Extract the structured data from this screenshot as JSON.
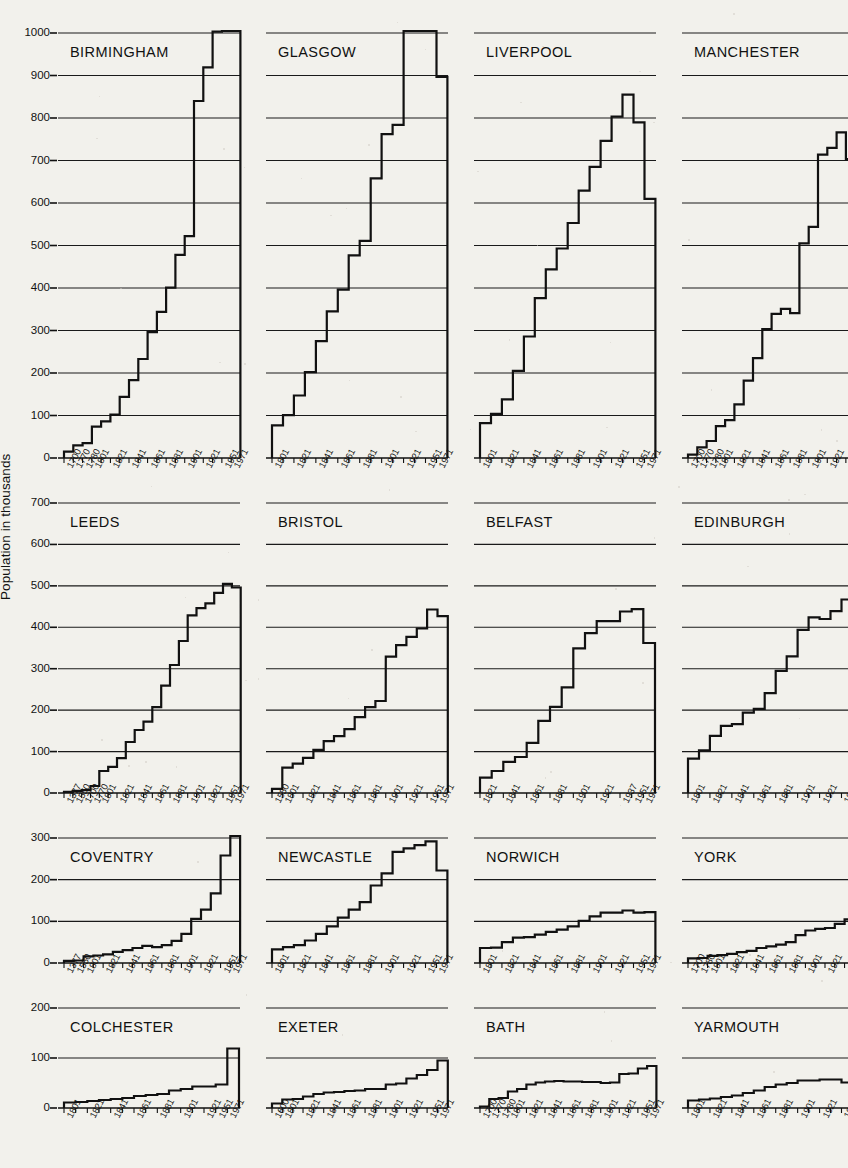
{
  "figure": {
    "y_axis_label": "Population in thousands",
    "units": "thousands"
  },
  "chart_data": {
    "type": "line",
    "title": "Population in thousands",
    "xlabel": "",
    "ylabel": "Population in thousands",
    "grid": true,
    "legend": "none",
    "note": "Small multiples: 16 step charts of British city population by census year. Four rows, each row shares a y-scale.",
    "rows": [
      {
        "row": 1,
        "ylim": [
          0,
          1000
        ],
        "yticks": [
          0,
          100,
          200,
          300,
          400,
          500,
          600,
          700,
          800,
          900,
          1000
        ]
      },
      {
        "row": 2,
        "ylim": [
          0,
          700
        ],
        "yticks": [
          0,
          100,
          200,
          300,
          400,
          500,
          600,
          700
        ]
      },
      {
        "row": 3,
        "ylim": [
          0,
          300
        ],
        "yticks": [
          0,
          100,
          200,
          300
        ]
      },
      {
        "row": 4,
        "ylim": [
          0,
          200
        ],
        "yticks": [
          0,
          100,
          200
        ]
      }
    ],
    "panels": [
      {
        "name": "BIRMINGHAM",
        "row": 1,
        "ylim": [
          0,
          1000
        ],
        "xticklabels": [
          "1700",
          "1770",
          "1780",
          "1801",
          "",
          "1821",
          "",
          "1841",
          "",
          "1861",
          "",
          "1881",
          "",
          "1901",
          "",
          "1921",
          "",
          "1951",
          "1971"
        ],
        "x": [
          1700,
          1770,
          1780,
          1801,
          1811,
          1821,
          1831,
          1841,
          1851,
          1861,
          1871,
          1881,
          1891,
          1901,
          1911,
          1921,
          1931,
          1951,
          1971
        ],
        "y": [
          15,
          30,
          35,
          74,
          86,
          102,
          144,
          183,
          233,
          296,
          344,
          401,
          478,
          522,
          840,
          919,
          1003,
          1113,
          1015
        ]
      },
      {
        "name": "GLASGOW",
        "row": 1,
        "ylim": [
          0,
          1000
        ],
        "xticklabels": [
          "1801",
          "",
          "1821",
          "",
          "1841",
          "",
          "1861",
          "",
          "1881",
          "",
          "1901",
          "",
          "1921",
          "",
          "1951",
          "1971"
        ],
        "x": [
          1801,
          1811,
          1821,
          1831,
          1841,
          1851,
          1861,
          1871,
          1881,
          1891,
          1901,
          1911,
          1921,
          1931,
          1951,
          1971
        ],
        "y": [
          77,
          101,
          147,
          202,
          275,
          345,
          396,
          477,
          511,
          658,
          762,
          784,
          1034,
          1088,
          1090,
          897
        ]
      },
      {
        "name": "LIVERPOOL",
        "row": 1,
        "ylim": [
          0,
          1000
        ],
        "xticklabels": [
          "1801",
          "",
          "1821",
          "",
          "1841",
          "",
          "1861",
          "",
          "1881",
          "",
          "1901",
          "",
          "1921",
          "",
          "1951",
          "1971"
        ],
        "x": [
          1801,
          1811,
          1821,
          1831,
          1841,
          1851,
          1861,
          1871,
          1881,
          1891,
          1901,
          1911,
          1921,
          1931,
          1951,
          1971
        ],
        "y": [
          82,
          104,
          138,
          205,
          286,
          376,
          444,
          493,
          553,
          629,
          685,
          746,
          803,
          855,
          790,
          610
        ]
      },
      {
        "name": "MANCHESTER",
        "row": 1,
        "ylim": [
          0,
          1000
        ],
        "xticklabels": [
          "1700",
          "1770",
          "1780",
          "1801",
          "",
          "1821",
          "",
          "1841",
          "",
          "1861",
          "",
          "1881",
          "",
          "1901",
          "",
          "1921",
          "",
          "1951",
          "1971"
        ],
        "x": [
          1700,
          1770,
          1780,
          1801,
          1811,
          1821,
          1831,
          1841,
          1851,
          1861,
          1871,
          1881,
          1891,
          1901,
          1911,
          1921,
          1931,
          1951,
          1971
        ],
        "y": [
          8,
          25,
          40,
          75,
          89,
          126,
          182,
          235,
          303,
          339,
          351,
          341,
          505,
          544,
          714,
          730,
          766,
          703,
          544
        ]
      },
      {
        "name": "LEEDS",
        "row": 2,
        "ylim": [
          0,
          700
        ],
        "xticklabels": [
          "1377",
          "1550",
          "1700",
          "1770",
          "1801",
          "",
          "1821",
          "",
          "1841",
          "",
          "1861",
          "",
          "1881",
          "",
          "1901",
          "",
          "1921",
          "",
          "1951",
          "1971"
        ],
        "x": [
          1377,
          1550,
          1700,
          1770,
          1801,
          1811,
          1821,
          1831,
          1841,
          1851,
          1861,
          1871,
          1881,
          1891,
          1901,
          1911,
          1921,
          1931,
          1951,
          1971
        ],
        "y": [
          3,
          5,
          7,
          17,
          53,
          63,
          84,
          123,
          152,
          172,
          207,
          259,
          309,
          367,
          429,
          446,
          458,
          483,
          505,
          496
        ]
      },
      {
        "name": "BRISTOL",
        "row": 2,
        "ylim": [
          0,
          700
        ],
        "xticklabels": [
          "1550",
          "1801",
          "",
          "1821",
          "",
          "1841",
          "",
          "1861",
          "",
          "1881",
          "",
          "1901",
          "",
          "1921",
          "",
          "1951",
          "1971"
        ],
        "x": [
          1550,
          1801,
          1811,
          1821,
          1831,
          1841,
          1851,
          1861,
          1871,
          1881,
          1891,
          1901,
          1911,
          1921,
          1931,
          1951,
          1971
        ],
        "y": [
          10,
          61,
          71,
          85,
          104,
          125,
          137,
          154,
          183,
          207,
          222,
          329,
          357,
          377,
          397,
          443,
          427
        ]
      },
      {
        "name": "BELFAST",
        "row": 2,
        "ylim": [
          0,
          700
        ],
        "xticklabels": [
          "1821",
          "",
          "1841",
          "",
          "1861",
          "",
          "1881",
          "",
          "1901",
          "",
          "1921",
          "",
          "1937",
          "1951",
          "1971"
        ],
        "x": [
          1821,
          1831,
          1841,
          1851,
          1861,
          1871,
          1881,
          1891,
          1901,
          1911,
          1921,
          1926,
          1937,
          1951,
          1971
        ],
        "y": [
          37,
          53,
          75,
          87,
          121,
          174,
          208,
          255,
          349,
          386,
          415,
          415,
          438,
          444,
          362
        ]
      },
      {
        "name": "EDINBURGH",
        "row": 2,
        "ylim": [
          0,
          700
        ],
        "xticklabels": [
          "1801",
          "",
          "1821",
          "",
          "1841",
          "",
          "1861",
          "",
          "1881",
          "",
          "1901",
          "",
          "1921",
          "",
          "1951",
          "1971"
        ],
        "x": [
          1801,
          1811,
          1821,
          1831,
          1841,
          1851,
          1861,
          1871,
          1881,
          1891,
          1901,
          1911,
          1921,
          1931,
          1951,
          1971
        ],
        "y": [
          83,
          103,
          138,
          162,
          166,
          194,
          203,
          241,
          295,
          330,
          394,
          424,
          420,
          439,
          467,
          453
        ]
      },
      {
        "name": "COVENTRY",
        "row": 3,
        "ylim": [
          0,
          300
        ],
        "xticklabels": [
          "1377",
          "1550",
          "1801",
          "",
          "1821",
          "",
          "1841",
          "",
          "1861",
          "",
          "1881",
          "",
          "1901",
          "",
          "1921",
          "",
          "1951",
          "1971"
        ],
        "x": [
          1377,
          1550,
          1801,
          1811,
          1821,
          1831,
          1841,
          1851,
          1861,
          1871,
          1881,
          1891,
          1901,
          1911,
          1921,
          1931,
          1951,
          1971
        ],
        "y": [
          5,
          6,
          16,
          18,
          21,
          27,
          31,
          36,
          41,
          38,
          43,
          53,
          70,
          106,
          128,
          167,
          258,
          335
        ]
      },
      {
        "name": "NEWCASTLE",
        "row": 3,
        "ylim": [
          0,
          300
        ],
        "xticklabels": [
          "1801",
          "",
          "1821",
          "",
          "1841",
          "",
          "1861",
          "",
          "1881",
          "",
          "1901",
          "",
          "1921",
          "",
          "1951",
          "1971"
        ],
        "x": [
          1801,
          1811,
          1821,
          1831,
          1841,
          1851,
          1861,
          1871,
          1881,
          1891,
          1901,
          1911,
          1921,
          1931,
          1951,
          1971
        ],
        "y": [
          33,
          38,
          43,
          54,
          70,
          88,
          109,
          128,
          146,
          186,
          215,
          267,
          275,
          283,
          292,
          222
        ]
      },
      {
        "name": "NORWICH",
        "row": 3,
        "ylim": [
          0,
          300
        ],
        "xticklabels": [
          "1801",
          "",
          "1821",
          "",
          "1841",
          "",
          "1861",
          "",
          "1881",
          "",
          "1901",
          "",
          "1921",
          "",
          "1951",
          "1971"
        ],
        "x": [
          1801,
          1811,
          1821,
          1831,
          1841,
          1851,
          1861,
          1871,
          1881,
          1891,
          1901,
          1911,
          1921,
          1931,
          1951,
          1971
        ],
        "y": [
          36,
          37,
          50,
          61,
          62,
          68,
          75,
          80,
          88,
          101,
          112,
          121,
          121,
          126,
          121,
          122
        ]
      },
      {
        "name": "YORK",
        "row": 3,
        "ylim": [
          0,
          300
        ],
        "xticklabels": [
          "1700",
          "1780",
          "1801",
          "",
          "1821",
          "",
          "1841",
          "",
          "1861",
          "",
          "1881",
          "",
          "1901",
          "",
          "1921",
          "",
          "1951",
          "1971"
        ],
        "x": [
          1700,
          1780,
          1801,
          1811,
          1821,
          1831,
          1841,
          1851,
          1861,
          1871,
          1881,
          1891,
          1901,
          1911,
          1921,
          1931,
          1951,
          1971
        ],
        "y": [
          11,
          12,
          17,
          19,
          22,
          26,
          29,
          36,
          40,
          44,
          50,
          67,
          78,
          82,
          84,
          94,
          105,
          105
        ]
      },
      {
        "name": "COLCHESTER",
        "row": 4,
        "ylim": [
          0,
          200
        ],
        "xticklabels": [
          "1801",
          "",
          "1821",
          "",
          "1841",
          "",
          "1861",
          "",
          "1881",
          "",
          "1901",
          "",
          "1921",
          "1951",
          "1971"
        ],
        "x": [
          1801,
          1811,
          1821,
          1831,
          1841,
          1851,
          1861,
          1871,
          1881,
          1891,
          1901,
          1911,
          1921,
          1951,
          1971
        ],
        "y": [
          11,
          12,
          14,
          16,
          18,
          20,
          24,
          26,
          28,
          35,
          38,
          43,
          43,
          47,
          119
        ]
      },
      {
        "name": "EXETER",
        "row": 4,
        "ylim": [
          0,
          200
        ],
        "xticklabels": [
          "1600",
          "1801",
          "",
          "1821",
          "",
          "1841",
          "",
          "1861",
          "",
          "1881",
          "",
          "1901",
          "",
          "1921",
          "",
          "1951",
          "1971"
        ],
        "x": [
          1600,
          1801,
          1811,
          1821,
          1831,
          1841,
          1851,
          1861,
          1871,
          1881,
          1891,
          1901,
          1911,
          1921,
          1931,
          1951,
          1971
        ],
        "y": [
          9,
          17,
          18,
          23,
          28,
          31,
          32,
          34,
          35,
          38,
          38,
          47,
          49,
          59,
          66,
          76,
          95
        ]
      },
      {
        "name": "BATH",
        "row": 4,
        "ylim": [
          0,
          200
        ],
        "xticklabels": [
          "1700",
          "1770",
          "1780",
          "1801",
          "",
          "1821",
          "",
          "1841",
          "",
          "1861",
          "",
          "1881",
          "",
          "1901",
          "",
          "1921",
          "",
          "1951",
          "1971"
        ],
        "x": [
          1700,
          1770,
          1780,
          1801,
          1811,
          1821,
          1831,
          1841,
          1851,
          1861,
          1871,
          1881,
          1891,
          1901,
          1911,
          1921,
          1931,
          1951,
          1971
        ],
        "y": [
          3,
          18,
          20,
          33,
          38,
          47,
          51,
          53,
          54,
          53,
          53,
          52,
          52,
          50,
          51,
          68,
          69,
          79,
          84
        ]
      },
      {
        "name": "YARMOUTH",
        "row": 4,
        "ylim": [
          0,
          200
        ],
        "xticklabels": [
          "1801",
          "",
          "1821",
          "",
          "1841",
          "",
          "1861",
          "",
          "1881",
          "",
          "1901",
          "",
          "1921",
          "",
          "1951",
          "1971"
        ],
        "x": [
          1801,
          1811,
          1821,
          1831,
          1841,
          1851,
          1861,
          1871,
          1881,
          1891,
          1901,
          1911,
          1921,
          1931,
          1951,
          1971
        ],
        "y": [
          15,
          17,
          19,
          22,
          25,
          30,
          35,
          42,
          47,
          50,
          55,
          55,
          57,
          57,
          51,
          50
        ]
      }
    ]
  }
}
